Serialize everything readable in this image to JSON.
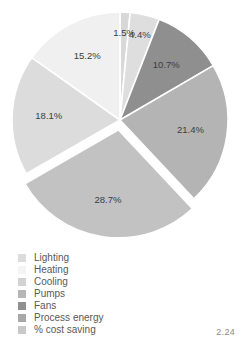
{
  "caption": "2.24",
  "chart_data": {
    "type": "pie",
    "title": "",
    "xlabel": "",
    "ylabel": "",
    "legend_position": "bottom-left",
    "grid": false,
    "exploded_slices": [
      "Process energy"
    ],
    "start_angle_deg": -90,
    "direction": "clockwise",
    "categories": [
      "Lighting",
      "Heating",
      "Cooling",
      "Pumps",
      "Fans",
      "Process energy",
      "% cost saving"
    ],
    "values": [
      1.5,
      4.4,
      10.7,
      21.4,
      28.7,
      18.1,
      15.2
    ],
    "colors": [
      "#d8d8d8",
      "#f2f2f2",
      "#cfcfcf",
      "#b4b4b4",
      "#8f8f8f",
      "#c2c2c2",
      "#e4e4e4"
    ],
    "slices": [
      {
        "label": "Lighting",
        "value": 1.5,
        "display": "1.5%",
        "color": "#d8d8d8",
        "exploded": false
      },
      {
        "label": "Heating",
        "value": 4.4,
        "display": "4.4%",
        "color": "#dedede",
        "exploded": false
      },
      {
        "label": "Cooling",
        "value": 10.7,
        "display": "10.7%",
        "color": "#8f8f8f",
        "exploded": false
      },
      {
        "label": "Pumps",
        "value": 21.4,
        "display": "21.4%",
        "color": "#b4b4b4",
        "exploded": false
      },
      {
        "label": "Process energy",
        "value": 28.7,
        "display": "28.7%",
        "color": "#c2c2c2",
        "exploded": true
      },
      {
        "label": "Fans",
        "value": 18.1,
        "display": "18.1%",
        "color": "#dcdcdc",
        "exploded": false
      },
      {
        "label": "% cost saving",
        "value": 15.2,
        "display": "15.2%",
        "color": "#f0f0f0",
        "exploded": false
      }
    ]
  },
  "legend": {
    "items": [
      {
        "label": "Lighting",
        "color": "#dcdcdc"
      },
      {
        "label": "Heating",
        "color": "#f4f4f4"
      },
      {
        "label": "Cooling",
        "color": "#d2d2d2"
      },
      {
        "label": "Pumps",
        "color": "#b6b6b6"
      },
      {
        "label": "Fans",
        "color": "#909090"
      },
      {
        "label": "Process energy",
        "color": "#a8a8a8"
      },
      {
        "label": "% cost saving",
        "color": "#c8c8c8"
      }
    ]
  }
}
